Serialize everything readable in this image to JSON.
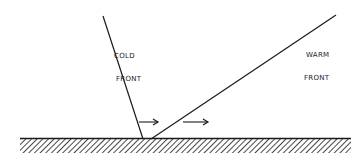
{
  "diagram": {
    "type": "weather-fronts-cross-section",
    "colors": {
      "background": "#ffffff",
      "ink": "#1a1a1a"
    },
    "cold_front": {
      "label_line1": "COLD",
      "label_line2": "FRONT",
      "line": {
        "x1": 103,
        "y1": 16,
        "x2": 143,
        "y2": 139
      }
    },
    "warm_front": {
      "label_line1": "WARM",
      "label_line2": "FRONT",
      "line": {
        "x1": 336,
        "y1": 15,
        "x2": 151,
        "y2": 139
      }
    },
    "arrows": [
      {
        "name": "cold-front-motion",
        "x1": 139,
        "y1": 122,
        "x2": 158,
        "y2": 122,
        "direction": "right"
      },
      {
        "name": "warm-front-motion",
        "x1": 183,
        "y1": 122,
        "x2": 208,
        "y2": 122,
        "direction": "right"
      }
    ],
    "ground": {
      "x1": 20,
      "x2": 351,
      "surface_y": 138,
      "hatch_bottom_y": 153
    }
  }
}
